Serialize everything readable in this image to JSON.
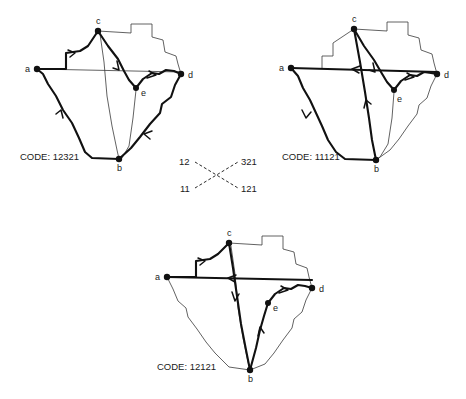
{
  "figure": {
    "node_labels": [
      "a",
      "b",
      "c",
      "d",
      "e"
    ],
    "code_prefix": "CODE:"
  },
  "panels": [
    {
      "id": "panel-top-left",
      "code_label": "CODE: 12321",
      "code_value": "12321",
      "nodes": [
        {
          "name": "a",
          "label": "a",
          "x": 37,
          "y": 69
        },
        {
          "name": "b",
          "label": "b",
          "x": 119,
          "y": 159
        },
        {
          "name": "c",
          "label": "c",
          "x": 98,
          "y": 31
        },
        {
          "name": "d",
          "label": "d",
          "x": 181,
          "y": 74
        },
        {
          "name": "e",
          "label": "e",
          "x": 136,
          "y": 88
        }
      ],
      "label_offsets": [
        {
          "name": "a",
          "dx": -10,
          "dy": 3
        },
        {
          "name": "b",
          "dx": -1,
          "dy": 11
        },
        {
          "name": "c",
          "dx": -1,
          "dy": -5
        },
        {
          "name": "d",
          "dx": 6,
          "dy": 4
        },
        {
          "name": "e",
          "dx": 6,
          "dy": 6
        }
      ],
      "edges": [
        {
          "name": "edge-a-c",
          "kind": "bold",
          "arrow": "forward"
        },
        {
          "name": "edge-c-e",
          "kind": "bold",
          "arrow": "forward"
        },
        {
          "name": "edge-e-d",
          "kind": "bold",
          "arrow": "forward"
        },
        {
          "name": "edge-d-b",
          "kind": "bold",
          "arrow": "forward"
        },
        {
          "name": "edge-b-a",
          "kind": "bold",
          "arrow": "forward"
        },
        {
          "name": "edge-a-d-chord",
          "kind": "thin",
          "arrow": "none"
        },
        {
          "name": "edge-c-b-chord",
          "kind": "thin",
          "arrow": "none"
        },
        {
          "name": "edge-e-b-chord",
          "kind": "thin",
          "arrow": "none"
        },
        {
          "name": "region-outline-north",
          "kind": "thin",
          "arrow": "none"
        }
      ]
    },
    {
      "id": "panel-top-right",
      "code_label": "CODE: 11121",
      "code_value": "11121",
      "nodes": [
        {
          "name": "a",
          "x": 291,
          "y": 68
        },
        {
          "name": "b",
          "x": 376,
          "y": 160
        },
        {
          "name": "c",
          "x": 354,
          "y": 29
        },
        {
          "name": "d",
          "x": 437,
          "y": 74
        },
        {
          "name": "e",
          "x": 394,
          "y": 90
        }
      ],
      "label_offsets": [
        {
          "name": "a",
          "dx": -10,
          "dy": 3
        },
        {
          "name": "b",
          "dx": -1,
          "dy": 11
        },
        {
          "name": "c",
          "dx": -1,
          "dy": -5
        },
        {
          "name": "d",
          "dx": 6,
          "dy": 4
        },
        {
          "name": "e",
          "dx": 4,
          "dy": 10
        }
      ],
      "edges": [
        {
          "name": "edge-d-a",
          "kind": "bold",
          "arrow": "forward"
        },
        {
          "name": "edge-a-b",
          "kind": "bold",
          "arrow": "forward"
        },
        {
          "name": "edge-b-c",
          "kind": "bold",
          "arrow": "forward"
        },
        {
          "name": "edge-c-e",
          "kind": "bold",
          "arrow": "forward"
        },
        {
          "name": "edge-e-d",
          "kind": "bold",
          "arrow": "forward"
        },
        {
          "name": "edge-e-b-chord",
          "kind": "thin",
          "arrow": "none"
        },
        {
          "name": "region-outline-north",
          "kind": "thin",
          "arrow": "none"
        }
      ]
    },
    {
      "id": "panel-bottom",
      "code_label": "CODE: 12121",
      "code_value": "12121",
      "nodes": [
        {
          "name": "a",
          "x": 167,
          "y": 277
        },
        {
          "name": "b",
          "x": 250,
          "y": 370
        },
        {
          "name": "c",
          "x": 229,
          "y": 243
        },
        {
          "name": "d",
          "x": 312,
          "y": 288
        },
        {
          "name": "e",
          "x": 268,
          "y": 303
        }
      ],
      "label_offsets": [
        {
          "name": "a",
          "dx": -10,
          "dy": 3
        },
        {
          "name": "b",
          "dx": -1,
          "dy": 11
        },
        {
          "name": "c",
          "dx": -1,
          "dy": -5
        },
        {
          "name": "d",
          "dx": 6,
          "dy": 4
        },
        {
          "name": "e",
          "dx": 6,
          "dy": 6
        }
      ],
      "edges": [
        {
          "name": "edge-a-c",
          "kind": "bold",
          "arrow": "forward"
        },
        {
          "name": "edge-c-b",
          "kind": "bold",
          "arrow": "forward"
        },
        {
          "name": "edge-b-e",
          "kind": "bold",
          "arrow": "forward"
        },
        {
          "name": "edge-e-d",
          "kind": "bold",
          "arrow": "forward"
        },
        {
          "name": "edge-d-a",
          "kind": "bold",
          "arrow": "forward"
        },
        {
          "name": "edge-c-b-chord",
          "kind": "thin",
          "arrow": "none"
        },
        {
          "name": "region-outline-north",
          "kind": "thin",
          "arrow": "none"
        }
      ]
    }
  ],
  "legend": {
    "id": "code-legend",
    "top_left": "12",
    "top_right": "321",
    "bottom_left": "11",
    "bottom_right": "121",
    "connector_style": "dashed-x"
  }
}
